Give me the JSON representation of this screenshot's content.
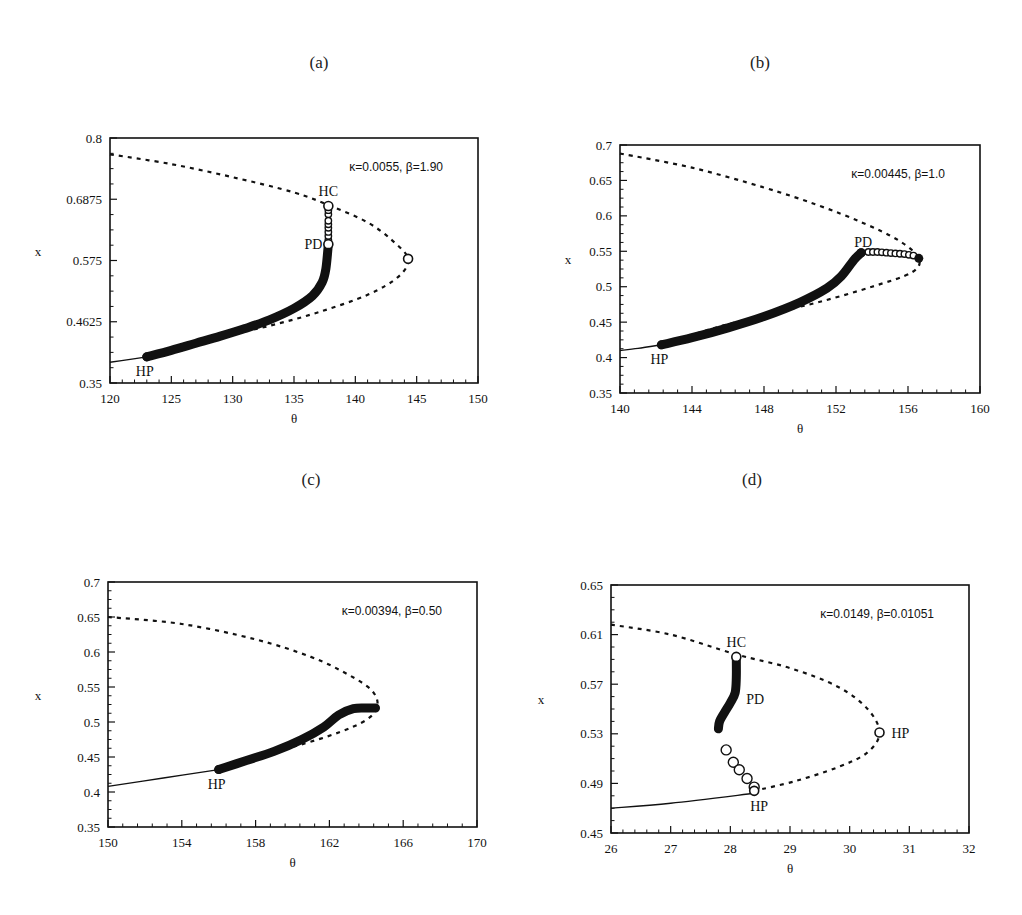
{
  "figure": {
    "panels": [
      "(a)",
      "(b)",
      "(c)",
      "(d)"
    ]
  },
  "chart_data": [
    {
      "id": "a",
      "panel_label": "(a)",
      "type": "line",
      "title": "",
      "parameters": "κ=0.0055, β=1.90",
      "xlabel": "θ",
      "ylabel": "x",
      "xlim": [
        120,
        150
      ],
      "ylim": [
        0.35,
        0.8
      ],
      "xticks": [
        120,
        125,
        130,
        135,
        140,
        145,
        150
      ],
      "yticks": [
        0.35,
        0.4625,
        0.575,
        0.6875,
        0.8
      ],
      "ytick_labels": [
        "0.35",
        "0.4625",
        "0.575",
        "0.6875",
        "0.8"
      ],
      "grid": false,
      "frame": {
        "x0": 110,
        "y0": 138,
        "x1": 478,
        "y1": 383
      },
      "series": [
        {
          "name": "stable steady state",
          "style": "solid",
          "x": [
            120,
            121.5,
            123
          ],
          "y": [
            0.388,
            0.393,
            0.398
          ]
        },
        {
          "name": "unstable steady state",
          "style": "dashed",
          "x": [
            120,
            125,
            130,
            135,
            138,
            141,
            143,
            144.3,
            143.5,
            141,
            137,
            133,
            129,
            126,
            123
          ],
          "y": [
            0.77,
            0.752,
            0.728,
            0.7,
            0.675,
            0.645,
            0.612,
            0.578,
            0.545,
            0.512,
            0.48,
            0.455,
            0.435,
            0.418,
            0.398
          ]
        },
        {
          "name": "periodic orbits (stable)",
          "style": "filled-circles",
          "x": [
            123,
            125,
            127,
            129,
            131,
            133,
            135,
            136.5,
            137.3,
            137.6,
            137.8
          ],
          "y": [
            0.398,
            0.41,
            0.423,
            0.436,
            0.45,
            0.466,
            0.487,
            0.51,
            0.535,
            0.56,
            0.605
          ]
        },
        {
          "name": "periodic orbits (unstable)",
          "style": "open-circles",
          "x": [
            137.8,
            137.8,
            137.8,
            137.8,
            137.8,
            137.8
          ],
          "y": [
            0.605,
            0.62,
            0.635,
            0.648,
            0.66,
            0.675
          ]
        }
      ],
      "special_points": [
        {
          "label": "HP",
          "x": 123,
          "y": 0.398,
          "marker": "filled"
        },
        {
          "label": "PD",
          "x": 137.8,
          "y": 0.605,
          "marker": "open"
        },
        {
          "label": "HC",
          "x": 137.8,
          "y": 0.675,
          "marker": "open"
        },
        {
          "label": "",
          "x": 144.3,
          "y": 0.578,
          "marker": "open"
        }
      ]
    },
    {
      "id": "b",
      "panel_label": "(b)",
      "type": "line",
      "title": "",
      "parameters": "κ=0.00445, β=1.0",
      "xlabel": "θ",
      "ylabel": "x",
      "xlim": [
        140,
        160
      ],
      "ylim": [
        0.35,
        0.7
      ],
      "xticks": [
        140,
        144,
        148,
        152,
        156,
        160
      ],
      "yticks": [
        0.35,
        0.4,
        0.45,
        0.5,
        0.55,
        0.6,
        0.65,
        0.7
      ],
      "ytick_labels": [
        "0.35",
        "0.4",
        "0.45",
        "0.5",
        "0.55",
        "0.6",
        "0.65",
        "0.7"
      ],
      "grid": false,
      "frame": {
        "x0": 620,
        "y0": 145,
        "x1": 980,
        "y1": 393
      },
      "series": [
        {
          "name": "stable steady state",
          "style": "solid",
          "x": [
            140,
            141,
            142.3
          ],
          "y": [
            0.41,
            0.413,
            0.418
          ]
        },
        {
          "name": "unstable steady state",
          "style": "dashed",
          "x": [
            140,
            144,
            148,
            151,
            153.5,
            155.5,
            156.6,
            156.2,
            154,
            151,
            148,
            145,
            142.3
          ],
          "y": [
            0.688,
            0.668,
            0.64,
            0.615,
            0.59,
            0.565,
            0.54,
            0.52,
            0.5,
            0.478,
            0.46,
            0.44,
            0.418
          ]
        },
        {
          "name": "periodic orbits (stable)",
          "style": "filled-circles",
          "x": [
            142.3,
            144,
            146,
            148,
            150,
            151.5,
            152.3,
            153,
            153.4
          ],
          "y": [
            0.418,
            0.428,
            0.442,
            0.458,
            0.478,
            0.498,
            0.515,
            0.538,
            0.548
          ]
        },
        {
          "name": "periodic orbits (unstable)",
          "style": "open-circles",
          "x": [
            153.8,
            154.3,
            154.8,
            155.3,
            155.8,
            156.3
          ],
          "y": [
            0.549,
            0.549,
            0.548,
            0.547,
            0.546,
            0.544
          ]
        }
      ],
      "special_points": [
        {
          "label": "HP",
          "x": 142.3,
          "y": 0.418,
          "marker": "filled"
        },
        {
          "label": "PD",
          "x": 153.4,
          "y": 0.548,
          "marker": "filled"
        },
        {
          "label": "",
          "x": 156.6,
          "y": 0.54,
          "marker": "filled"
        }
      ]
    },
    {
      "id": "c",
      "panel_label": "(c)",
      "type": "line",
      "title": "",
      "parameters": "κ=0.00394, β=0.50",
      "xlabel": "θ",
      "ylabel": "x",
      "xlim": [
        150,
        170
      ],
      "ylim": [
        0.35,
        0.7
      ],
      "xticks": [
        150,
        154,
        158,
        162,
        166,
        170
      ],
      "yticks": [
        0.35,
        0.4,
        0.45,
        0.5,
        0.55,
        0.6,
        0.65,
        0.7
      ],
      "ytick_labels": [
        "0.35",
        "0.4",
        "0.45",
        "0.5",
        "0.55",
        "0.6",
        "0.65",
        "0.7"
      ],
      "grid": false,
      "frame": {
        "x0": 108,
        "y0": 582,
        "x1": 477,
        "y1": 827
      },
      "series": [
        {
          "name": "stable steady state",
          "style": "solid",
          "x": [
            150,
            153,
            156
          ],
          "y": [
            0.408,
            0.42,
            0.432
          ]
        },
        {
          "name": "unstable steady state",
          "style": "dashed",
          "x": [
            150,
            154,
            158,
            161,
            163,
            164.3,
            164.6,
            164,
            162.5,
            160.5,
            159
          ],
          "y": [
            0.65,
            0.64,
            0.618,
            0.593,
            0.568,
            0.545,
            0.522,
            0.503,
            0.485,
            0.468,
            0.458
          ]
        },
        {
          "name": "periodic orbits (stable)",
          "style": "filled-circles",
          "x": [
            156,
            157.5,
            159,
            160.5,
            161.7,
            162.5,
            163.3,
            164,
            164.5
          ],
          "y": [
            0.432,
            0.445,
            0.458,
            0.475,
            0.493,
            0.51,
            0.519,
            0.52,
            0.52
          ]
        }
      ],
      "special_points": [
        {
          "label": "HP",
          "x": 156,
          "y": 0.432,
          "marker": "filled"
        }
      ]
    },
    {
      "id": "d",
      "panel_label": "(d)",
      "type": "line",
      "title": "",
      "parameters": "κ=0.0149, β=0.01051",
      "xlabel": "θ",
      "ylabel": "x",
      "xlim": [
        26,
        32
      ],
      "ylim": [
        0.45,
        0.65
      ],
      "xticks": [
        26,
        27,
        28,
        29,
        30,
        31,
        32
      ],
      "yticks": [
        0.45,
        0.49,
        0.53,
        0.57,
        0.61,
        0.65
      ],
      "ytick_labels": [
        "0.45",
        "0.49",
        "0.53",
        "0.57",
        "0.61",
        "0.65"
      ],
      "grid": false,
      "frame": {
        "x0": 611,
        "y0": 585,
        "x1": 969,
        "y1": 833
      },
      "series": [
        {
          "name": "stable steady state",
          "style": "solid",
          "x": [
            26,
            27,
            28.4
          ],
          "y": [
            0.47,
            0.474,
            0.482
          ]
        },
        {
          "name": "unstable steady state",
          "style": "dashed",
          "x": [
            26,
            27,
            28.1,
            29,
            29.8,
            30.3,
            30.5,
            30.3,
            29.8,
            29.1,
            28.4
          ],
          "y": [
            0.618,
            0.61,
            0.594,
            0.583,
            0.568,
            0.55,
            0.531,
            0.515,
            0.503,
            0.492,
            0.484
          ]
        },
        {
          "name": "periodic orbits (HC branch)",
          "style": "filled-circles",
          "x": [
            28.1,
            28.1,
            28.08,
            28.0,
            27.9,
            27.82,
            27.8
          ],
          "y": [
            0.592,
            0.575,
            0.563,
            0.555,
            0.547,
            0.54,
            0.534
          ]
        },
        {
          "name": "periodic orbits (HP branch)",
          "style": "open-circles",
          "x": [
            27.93,
            28.05,
            28.15,
            28.28,
            28.4
          ],
          "y": [
            0.517,
            0.507,
            0.501,
            0.494,
            0.487
          ]
        }
      ],
      "special_points": [
        {
          "label": "HC",
          "x": 28.1,
          "y": 0.592,
          "marker": "open"
        },
        {
          "label": "PD",
          "x": 28.1,
          "y": 0.557,
          "marker": "none"
        },
        {
          "label": "HP",
          "x": 30.5,
          "y": 0.531,
          "marker": "open"
        },
        {
          "label": "HP",
          "x": 28.4,
          "y": 0.484,
          "marker": "open"
        }
      ]
    }
  ]
}
